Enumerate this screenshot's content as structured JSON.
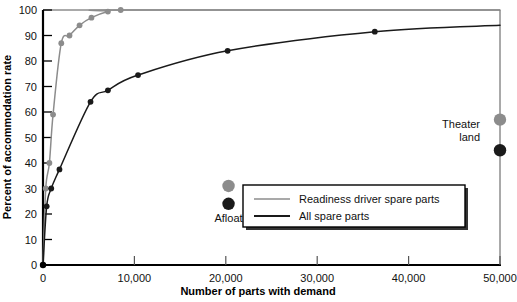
{
  "chart_data": {
    "type": "line",
    "title": "",
    "xlabel": "Number of parts with demand",
    "ylabel": "Percent of accommodation rate",
    "xlim": [
      0,
      50000
    ],
    "ylim": [
      0,
      100
    ],
    "xticks": [
      0,
      10000,
      20000,
      30000,
      40000,
      50000
    ],
    "xticklabels": [
      "0",
      "10,000",
      "20,000",
      "30,000",
      "40,000",
      "50,000"
    ],
    "yticks": [
      0,
      10,
      20,
      30,
      40,
      50,
      60,
      70,
      80,
      90,
      100
    ],
    "yticklabels": [
      "0",
      "10",
      "20",
      "30",
      "40",
      "50",
      "60",
      "70",
      "80",
      "90",
      "100"
    ],
    "grid": false,
    "legend_position": "center-right",
    "series": [
      {
        "name": "Readiness driver spare parts",
        "color": "#8c8c8c",
        "marker": "circle",
        "points": [
          {
            "x": 0,
            "y": 0
          },
          {
            "x": 300,
            "y": 30
          },
          {
            "x": 700,
            "y": 40
          },
          {
            "x": 1100,
            "y": 59
          },
          {
            "x": 2000,
            "y": 87
          },
          {
            "x": 2900,
            "y": 90
          },
          {
            "x": 4000,
            "y": 94
          },
          {
            "x": 5300,
            "y": 97
          },
          {
            "x": 7100,
            "y": 99.4
          },
          {
            "x": 8500,
            "y": 100
          },
          {
            "x": 50000,
            "y": 100
          }
        ]
      },
      {
        "name": "All spare parts",
        "color": "#1a1a1a",
        "marker": "circle",
        "points": [
          {
            "x": 0,
            "y": 0
          },
          {
            "x": 400,
            "y": 23
          },
          {
            "x": 900,
            "y": 30
          },
          {
            "x": 1800,
            "y": 37.5
          },
          {
            "x": 5200,
            "y": 64
          },
          {
            "x": 7100,
            "y": 68.5
          },
          {
            "x": 10400,
            "y": 74.5
          },
          {
            "x": 20200,
            "y": 84
          },
          {
            "x": 36300,
            "y": 91.5
          },
          {
            "x": 50000,
            "y": 94
          }
        ]
      }
    ],
    "annotated_points": [
      {
        "group": "Afloat",
        "label": "Afloat",
        "items": [
          {
            "series": "Readiness driver spare parts",
            "x": 20300,
            "y": 31,
            "color": "#8c8c8c"
          },
          {
            "series": "All spare parts",
            "x": 20300,
            "y": 24,
            "color": "#1a1a1a"
          }
        ]
      },
      {
        "group": "Theater land",
        "label": "Theater\nland",
        "label_line1": "Theater",
        "label_line2": "land",
        "items": [
          {
            "series": "Readiness driver spare parts",
            "x": 50000,
            "y": 57,
            "color": "#8c8c8c"
          },
          {
            "series": "All spare parts",
            "x": 50000,
            "y": 45,
            "color": "#1a1a1a"
          }
        ]
      }
    ],
    "legend_entries": [
      {
        "label": "Readiness driver spare parts",
        "color": "#8c8c8c"
      },
      {
        "label": "All spare parts",
        "color": "#1a1a1a"
      }
    ]
  },
  "colors": {
    "readiness_driver": "#8c8c8c",
    "all_spare_parts": "#1a1a1a",
    "axis": "#000000",
    "background": "#ffffff",
    "legend_border": "#000000",
    "legend_shadow": "#222222"
  }
}
